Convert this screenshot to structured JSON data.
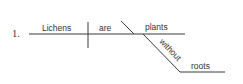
{
  "diagram": {
    "type": "sentence-diagram",
    "item_number": "1.",
    "sentence": "Lichens are plants without roots",
    "subject": "Lichens",
    "verb": "are",
    "predicate_nominative": "plants",
    "preposition": "without",
    "prepositional_object": "roots",
    "line_color": "#3a3a3a",
    "text_color": "#333333"
  }
}
